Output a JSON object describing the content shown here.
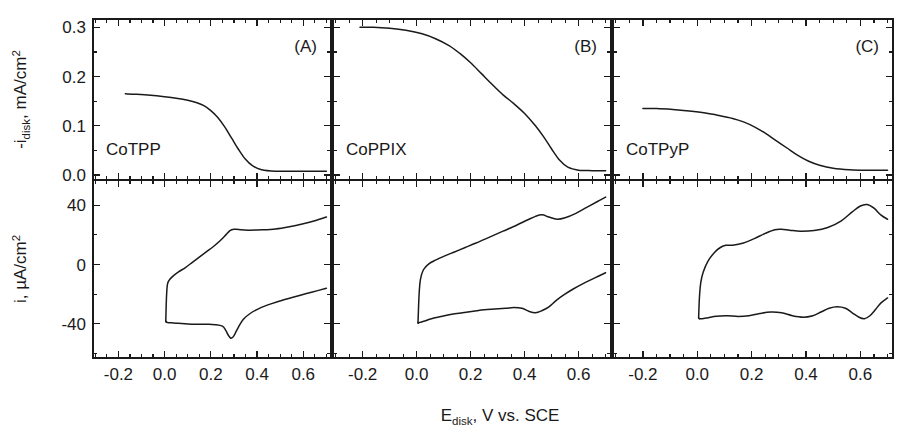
{
  "figure": {
    "xaxis": {
      "title_main": "E",
      "title_sub": "disk",
      "title_rest": ", V vs. SCE",
      "tick_labels": [
        "-0.2",
        "0.0",
        "0.2",
        "0.4",
        "0.6"
      ],
      "tick_values": [
        -0.2,
        0.0,
        0.2,
        0.4,
        0.6
      ],
      "minor_step": 0.05,
      "xlim": [
        -0.31,
        0.72
      ]
    },
    "yaxis_top": {
      "title_pre": "-i",
      "title_sub": "disk",
      "title_rest": ", mA/cm",
      "title_sup": "2",
      "tick_labels": [
        "0.0",
        "0.1",
        "0.2",
        "0.3"
      ],
      "tick_values": [
        0.0,
        0.1,
        0.2,
        0.3
      ],
      "ylim": [
        -0.01,
        0.317
      ]
    },
    "yaxis_bottom": {
      "title_pre": "i, ",
      "title_mu": "µ",
      "title_rest": "A/cm",
      "title_sup": "2",
      "tick_labels": [
        "-40",
        "0",
        "40"
      ],
      "tick_values": [
        -40,
        0,
        40
      ],
      "ylim": [
        -63,
        57
      ]
    },
    "colors": {
      "ink": "#1a1a1a",
      "background": "#ffffff"
    }
  },
  "chart_data": {
    "type": "line",
    "title": "",
    "xlabel": "E_disk, V vs. SCE",
    "panels": [
      {
        "tag": "(A)",
        "sample": "CoTPP",
        "rde": {
          "ylabel": "-i_disk, mA/cm^2",
          "ylim": [
            -0.01,
            0.317
          ],
          "xlim": [
            -0.31,
            0.72
          ],
          "x": [
            -0.17,
            -0.12,
            -0.06,
            0.0,
            0.05,
            0.1,
            0.14,
            0.17,
            0.2,
            0.23,
            0.26,
            0.29,
            0.32,
            0.35,
            0.38,
            0.42,
            0.48,
            0.55,
            0.62,
            0.7
          ],
          "y": [
            0.165,
            0.164,
            0.162,
            0.159,
            0.156,
            0.152,
            0.147,
            0.141,
            0.131,
            0.117,
            0.098,
            0.075,
            0.052,
            0.032,
            0.019,
            0.011,
            0.008,
            0.008,
            0.008,
            0.008
          ]
        },
        "cv": {
          "ylabel": "i, uA/cm^2",
          "ylim": [
            -63,
            57
          ],
          "xlim": [
            -0.31,
            0.72
          ],
          "forward_x": [
            0.005,
            0.008,
            0.012,
            0.02,
            0.035,
            0.06,
            0.09,
            0.12,
            0.15,
            0.18,
            0.21,
            0.24,
            0.265,
            0.28,
            0.29,
            0.3,
            0.32,
            0.36,
            0.42,
            0.48,
            0.54,
            0.6,
            0.65,
            0.7
          ],
          "forward_y": [
            -38.0,
            -22.0,
            -13.5,
            -10.5,
            -8.0,
            -5.0,
            -2.0,
            1.5,
            5.0,
            8.5,
            12.0,
            16.0,
            20.0,
            22.5,
            23.5,
            23.8,
            23.6,
            23.2,
            23.4,
            24.0,
            25.5,
            27.5,
            29.5,
            32.0
          ],
          "reverse_x": [
            0.7,
            0.64,
            0.58,
            0.52,
            0.46,
            0.41,
            0.37,
            0.34,
            0.32,
            0.305,
            0.295,
            0.285,
            0.275,
            0.265,
            0.25,
            0.22,
            0.18,
            0.14,
            0.1,
            0.06,
            0.03,
            0.012,
            0.006
          ],
          "reverse_y": [
            -16.0,
            -18.5,
            -21.0,
            -23.5,
            -26.5,
            -29.5,
            -33.0,
            -37.0,
            -42.0,
            -46.5,
            -49.0,
            -49.5,
            -47.5,
            -44.5,
            -41.5,
            -40.5,
            -40.3,
            -40.2,
            -40.0,
            -39.6,
            -39.3,
            -39.0,
            -38.5
          ]
        }
      },
      {
        "tag": "(B)",
        "sample": "CoPPIX",
        "rde": {
          "ylabel": "-i_disk, mA/cm^2",
          "ylim": [
            -0.01,
            0.317
          ],
          "xlim": [
            -0.31,
            0.72
          ],
          "x": [
            -0.21,
            -0.16,
            -0.1,
            -0.04,
            0.02,
            0.07,
            0.12,
            0.16,
            0.2,
            0.24,
            0.28,
            0.32,
            0.36,
            0.4,
            0.44,
            0.47,
            0.5,
            0.53,
            0.56,
            0.6,
            0.65,
            0.7
          ],
          "y": [
            0.3,
            0.3,
            0.298,
            0.294,
            0.287,
            0.277,
            0.263,
            0.247,
            0.228,
            0.206,
            0.184,
            0.163,
            0.145,
            0.125,
            0.1,
            0.078,
            0.053,
            0.03,
            0.016,
            0.01,
            0.009,
            0.009
          ]
        },
        "cv": {
          "ylabel": "i, uA/cm^2",
          "ylim": [
            -63,
            57
          ],
          "xlim": [
            -0.31,
            0.72
          ],
          "forward_x": [
            0.005,
            0.009,
            0.014,
            0.025,
            0.045,
            0.07,
            0.1,
            0.14,
            0.18,
            0.22,
            0.27,
            0.32,
            0.37,
            0.41,
            0.44,
            0.465,
            0.49,
            0.52,
            0.55,
            0.59,
            0.63,
            0.67,
            0.7
          ],
          "forward_y": [
            -39.0,
            -20.0,
            -10.0,
            -3.5,
            0.5,
            3.0,
            5.5,
            8.5,
            11.5,
            14.5,
            18.5,
            22.5,
            26.5,
            30.0,
            32.5,
            33.5,
            32.0,
            30.5,
            31.5,
            34.5,
            38.5,
            42.5,
            45.5
          ],
          "reverse_x": [
            0.7,
            0.66,
            0.62,
            0.58,
            0.545,
            0.515,
            0.49,
            0.465,
            0.44,
            0.415,
            0.39,
            0.36,
            0.33,
            0.29,
            0.25,
            0.21,
            0.17,
            0.13,
            0.09,
            0.055,
            0.03,
            0.012,
            0.006
          ],
          "reverse_y": [
            -5.5,
            -9.0,
            -12.5,
            -16.5,
            -20.5,
            -24.5,
            -28.5,
            -31.0,
            -32.5,
            -31.5,
            -29.5,
            -29.0,
            -29.5,
            -30.0,
            -30.5,
            -31.5,
            -32.5,
            -33.5,
            -35.0,
            -36.5,
            -38.0,
            -39.0,
            -39.5
          ]
        }
      },
      {
        "tag": "(C)",
        "sample": "CoTPyP",
        "rde": {
          "ylabel": "-i_disk, mA/cm^2",
          "ylim": [
            -0.01,
            0.317
          ],
          "xlim": [
            -0.31,
            0.72
          ],
          "x": [
            -0.2,
            -0.15,
            -0.09,
            -0.03,
            0.03,
            0.08,
            0.13,
            0.17,
            0.21,
            0.25,
            0.29,
            0.33,
            0.37,
            0.41,
            0.45,
            0.5,
            0.56,
            0.62,
            0.7
          ],
          "y": [
            0.135,
            0.135,
            0.133,
            0.13,
            0.126,
            0.121,
            0.115,
            0.108,
            0.098,
            0.085,
            0.07,
            0.055,
            0.04,
            0.028,
            0.02,
            0.014,
            0.011,
            0.01,
            0.01
          ]
        },
        "cv": {
          "ylabel": "i, uA/cm^2",
          "ylim": [
            -63,
            57
          ],
          "xlim": [
            -0.31,
            0.72
          ],
          "forward_x": [
            0.005,
            0.008,
            0.013,
            0.022,
            0.04,
            0.065,
            0.085,
            0.105,
            0.13,
            0.17,
            0.21,
            0.25,
            0.285,
            0.31,
            0.34,
            0.38,
            0.43,
            0.48,
            0.53,
            0.57,
            0.6,
            0.625,
            0.65,
            0.675,
            0.7
          ],
          "forward_y": [
            -36.0,
            -22.0,
            -12.0,
            -5.0,
            2.5,
            8.5,
            11.5,
            13.0,
            13.0,
            14.5,
            17.5,
            21.0,
            23.5,
            23.8,
            23.2,
            22.5,
            23.0,
            25.0,
            29.5,
            35.5,
            39.5,
            40.5,
            38.0,
            33.5,
            30.5
          ],
          "reverse_x": [
            0.7,
            0.675,
            0.655,
            0.635,
            0.615,
            0.595,
            0.57,
            0.545,
            0.515,
            0.485,
            0.455,
            0.425,
            0.39,
            0.35,
            0.31,
            0.27,
            0.23,
            0.19,
            0.15,
            0.11,
            0.07,
            0.04,
            0.018,
            0.008
          ],
          "reverse_y": [
            -22.5,
            -26.0,
            -30.5,
            -34.5,
            -36.5,
            -35.5,
            -32.5,
            -29.5,
            -28.5,
            -29.5,
            -32.0,
            -34.5,
            -35.5,
            -34.5,
            -32.5,
            -32.0,
            -33.0,
            -34.5,
            -35.0,
            -34.5,
            -34.8,
            -35.8,
            -36.5,
            -36.5
          ]
        }
      }
    ]
  }
}
